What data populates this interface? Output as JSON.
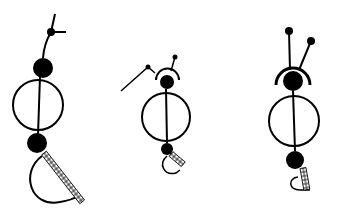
{
  "diagram": {
    "stroke_color": "#000000",
    "background": "#ffffff",
    "figures": [
      {
        "name": "figure-left",
        "parts": [
          "antenna-branch",
          "head-dot",
          "body-circle",
          "base-dot",
          "half-circle-with-ladder"
        ]
      },
      {
        "name": "figure-middle",
        "parts": [
          "arm-line",
          "head-arc",
          "antenna",
          "head-dot",
          "body-circle",
          "base-dot",
          "half-circle-with-ladder"
        ]
      },
      {
        "name": "figure-right",
        "parts": [
          "two-antennae",
          "head-arc",
          "head-dot",
          "body-circle",
          "base-dot",
          "half-circle-with-ladder"
        ]
      }
    ]
  }
}
